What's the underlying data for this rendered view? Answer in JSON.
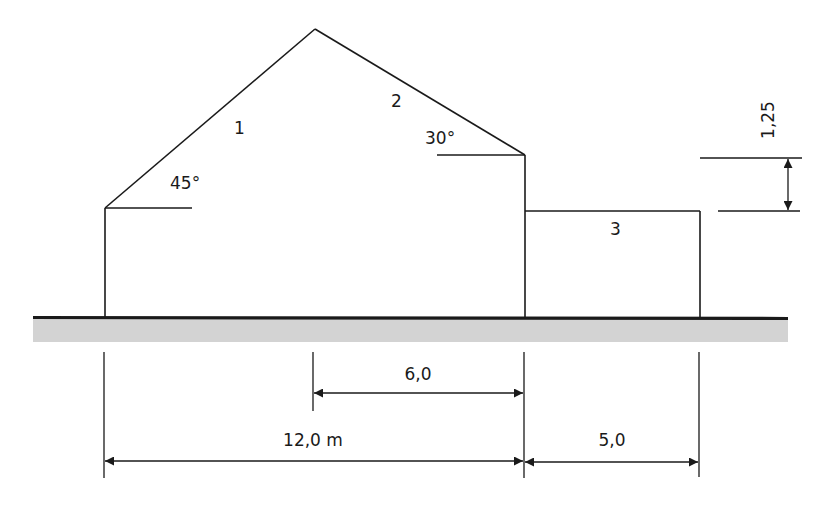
{
  "diagram": {
    "type": "building cross-section with roof segments and dimensions",
    "colors": {
      "line": "#1a1a1a",
      "ground_fill": "#d3d3d3",
      "background": "#ffffff"
    },
    "segments": [
      {
        "id": "1",
        "label": "1",
        "description": "left roof slope"
      },
      {
        "id": "2",
        "label": "2",
        "description": "right roof slope"
      },
      {
        "id": "3",
        "label": "3",
        "description": "flat roof annex"
      }
    ],
    "angles": [
      {
        "label": "45°",
        "segment": "1"
      },
      {
        "label": "30°",
        "segment": "2"
      }
    ],
    "dimensions": {
      "total_width": "12,0 m",
      "half_width": "6,0",
      "annex_width": "5,0",
      "height_diff": "1,25"
    }
  }
}
